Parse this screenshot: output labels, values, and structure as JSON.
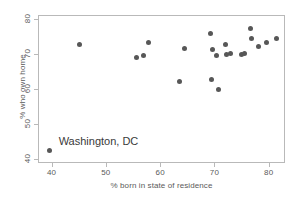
{
  "chart_data": {
    "type": "scatter",
    "title": "",
    "xlabel": "% born in state of residence",
    "ylabel": "% who own home",
    "xlim": [
      37.5,
      83.0
    ],
    "ylim": [
      39.0,
      81.0
    ],
    "xticks": [
      40,
      50,
      60,
      70,
      80
    ],
    "yticks": [
      40,
      50,
      60,
      70,
      80
    ],
    "xtick_labels": [
      "40",
      "50",
      "60",
      "70",
      "80"
    ],
    "ytick_labels": [
      "40",
      "50",
      "60",
      "70",
      "80"
    ],
    "grid": false,
    "legend": null,
    "marker_color": "#575757",
    "marker_size": 5,
    "points": [
      {
        "x": 39.6,
        "y": 42.5
      },
      {
        "x": 45.1,
        "y": 72.6
      },
      {
        "x": 55.7,
        "y": 69.0
      },
      {
        "x": 57.0,
        "y": 69.6
      },
      {
        "x": 57.9,
        "y": 73.2
      },
      {
        "x": 63.5,
        "y": 62.1
      },
      {
        "x": 64.5,
        "y": 71.6
      },
      {
        "x": 69.3,
        "y": 75.7
      },
      {
        "x": 69.4,
        "y": 62.8
      },
      {
        "x": 69.7,
        "y": 71.1
      },
      {
        "x": 70.4,
        "y": 69.5
      },
      {
        "x": 70.8,
        "y": 59.9
      },
      {
        "x": 72.0,
        "y": 72.7
      },
      {
        "x": 72.3,
        "y": 69.9
      },
      {
        "x": 73.0,
        "y": 70.0
      },
      {
        "x": 75.0,
        "y": 69.9
      },
      {
        "x": 75.6,
        "y": 70.2
      },
      {
        "x": 76.6,
        "y": 77.1
      },
      {
        "x": 76.8,
        "y": 74.4
      },
      {
        "x": 78.2,
        "y": 72.2
      },
      {
        "x": 79.6,
        "y": 73.1
      },
      {
        "x": 81.5,
        "y": 74.2
      }
    ],
    "annotations": [
      {
        "text": "Washington, DC",
        "x": 41.3,
        "y": 44.6
      }
    ]
  }
}
